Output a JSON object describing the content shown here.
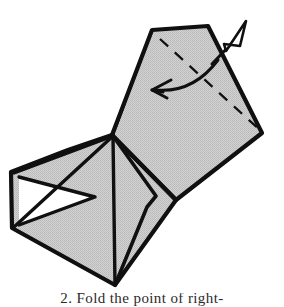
{
  "figure": {
    "alt_description": "Shaded paper model with a large flap being folded over; a curved fold arrow and a hollow push arrow indicate the motion.",
    "background_color": "#ffffff",
    "paper": {
      "front_fill": "#c9c9c9",
      "back_fill": "#ffffff",
      "edge_color": "#101010",
      "crease_color": "#101010",
      "hidden_edge_style": "dashed"
    },
    "arrows": {
      "fold_arrow": {
        "name": "curved-fold-arrow",
        "style": "curved-solid-line",
        "head_style": "open-barb",
        "direction": "right-to-left",
        "color": "#101010"
      },
      "push_arrow": {
        "name": "hollow-push-arrow",
        "style": "straight-line",
        "head_style": "hollow-triangle",
        "direction": "up-right",
        "color": "#101010"
      }
    },
    "geometry": {
      "upper_flap": [
        [
          152,
          30
        ],
        [
          208,
          26
        ],
        [
          262,
          133
        ],
        [
          176,
          200
        ],
        [
          112,
          135
        ]
      ],
      "lower_body": [
        [
          112,
          135
        ],
        [
          176,
          200
        ],
        [
          115,
          285
        ],
        [
          12,
          228
        ],
        [
          11,
          172
        ],
        [
          68,
          150
        ]
      ],
      "left_white_triangle": [
        [
          20,
          178
        ],
        [
          92,
          196
        ],
        [
          20,
          224
        ]
      ],
      "center_crease": [
        [
          112,
          135
        ],
        [
          115,
          285
        ]
      ],
      "inner_flap": [
        [
          112,
          135
        ],
        [
          155,
          196
        ],
        [
          147,
          206
        ],
        [
          115,
          285
        ]
      ],
      "left_crease": [
        [
          112,
          135
        ],
        [
          11,
          172
        ]
      ],
      "left_fan_crease": [
        [
          112,
          135
        ],
        [
          12,
          228
        ]
      ],
      "hidden_crease": [
        [
          160,
          38
        ],
        [
          262,
          133
        ]
      ],
      "right_thin_crease": [
        [
          112,
          135
        ],
        [
          176,
          200
        ]
      ]
    }
  },
  "caption": {
    "text": "2. Fold the point of right-",
    "visible_portion": "top edge of letters only, clipped by image crop"
  }
}
